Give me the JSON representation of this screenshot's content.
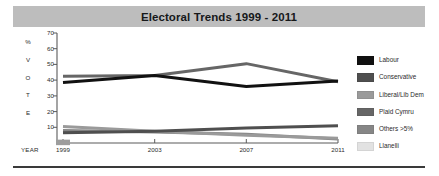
{
  "title": {
    "text": "Electoral Trends 1999 - 2011",
    "banner_color": "#bdbdbd"
  },
  "axis": {
    "vertical_title_letters": [
      "%",
      "V",
      "O",
      "T",
      "E"
    ],
    "vertical_title": "% VOTE",
    "horizontal_title": "YEAR"
  },
  "legend": {
    "items": [
      {
        "label": "Labour",
        "color": "#111111"
      },
      {
        "label": "Conservative",
        "color": "#4f4f4f"
      },
      {
        "label": "Liberal/Lib Dem",
        "color": "#9a9a9a"
      },
      {
        "label": "Plaid Cymru",
        "color": "#666666"
      },
      {
        "label": "Others >5%",
        "color": "#868686"
      },
      {
        "label": "Llanelli",
        "color": "#e2e2e2"
      }
    ]
  },
  "chart_data": {
    "type": "line",
    "title": "Electoral Trends 1999 - 2011",
    "xlabel": "YEAR",
    "ylabel": "% VOTE",
    "categories": [
      "1999",
      "2003",
      "2007",
      "2011"
    ],
    "x": [
      1999,
      2003,
      2007,
      2011
    ],
    "xlim": [
      1999,
      2011
    ],
    "ylim": [
      0,
      70
    ],
    "yticks": [
      10,
      20,
      30,
      40,
      50,
      60,
      70
    ],
    "xticks": [
      "1999",
      "2003",
      "2007",
      "2011"
    ],
    "grid": false,
    "legend_position": "right",
    "series": [
      {
        "name": "Labour",
        "color": "#111111",
        "values": [
          38.5,
          43.0,
          36.0,
          39.5
        ]
      },
      {
        "name": "Conservative",
        "color": "#4f4f4f",
        "values": [
          6.5,
          7.5,
          9.5,
          11.0
        ]
      },
      {
        "name": "Liberal/Lib Dem",
        "color": "#9a9a9a",
        "values": [
          10.5,
          7.5,
          5.0,
          3.0
        ]
      },
      {
        "name": "Plaid Cymru",
        "color": "#666666",
        "values": [
          42.5,
          43.0,
          50.5,
          39.0
        ]
      },
      {
        "name": "Others >5%",
        "color": "#868686",
        "values": [
          8.0,
          7.0,
          5.5,
          2.5
        ]
      },
      {
        "name": "Llanelli",
        "color": "#e2e2e2",
        "values": [
          1.5,
          0.0,
          0.0,
          0.0
        ]
      }
    ]
  }
}
